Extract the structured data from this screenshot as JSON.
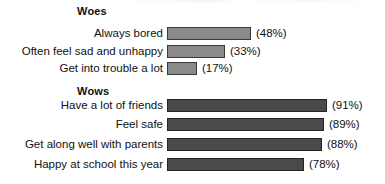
{
  "chart_data": {
    "type": "bar",
    "orientation": "horizontal",
    "title": "",
    "xlabel": "",
    "ylabel": "",
    "xlim": [
      0,
      100
    ],
    "grid": false,
    "legend": false,
    "value_suffix": "%",
    "value_format": "(NN%)",
    "groups": [
      {
        "name": "Woes",
        "label": "Woes",
        "color": "#8a8a8a",
        "border_color": "#3a3a3a",
        "categories": [
          "Always bored",
          "Often feel sad and unhappy",
          "Get into trouble a lot"
        ],
        "values": [
          48,
          33,
          17
        ],
        "value_labels": [
          "(48%)",
          "(33%)",
          "(17%)"
        ]
      },
      {
        "name": "Wows",
        "label": "Wows",
        "color": "#4a4a4a",
        "border_color": "#242424",
        "categories": [
          "Have a lot of friends",
          "Feel safe",
          "Get along well with parents",
          "Happy at school this year"
        ],
        "values": [
          91,
          89,
          88,
          78
        ],
        "value_labels": [
          "(91%)",
          "(89%)",
          "(88%)",
          "(78%)"
        ]
      }
    ]
  },
  "layout": {
    "bar_origin_x": 167,
    "px_per_percent": 1.76,
    "bar_height": 13,
    "label_right_edge": 163,
    "value_gap": 5,
    "heading_x": 77,
    "rows": {
      "woes_heading_y": 5,
      "woes_row_y": [
        26,
        44,
        61
      ],
      "wows_heading_y": 85,
      "wows_row_y": [
        98,
        117,
        137,
        157
      ]
    }
  }
}
